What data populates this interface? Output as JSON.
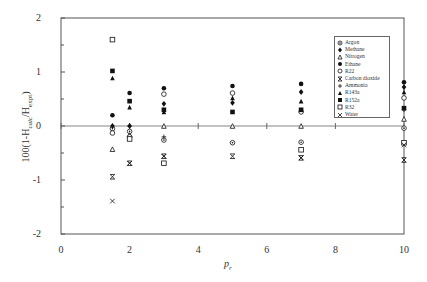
{
  "chart_data": {
    "type": "scatter",
    "title": "",
    "xlabel": "p r",
    "ylabel": "100(1-H calc/H expt)",
    "xlim": [
      0,
      10
    ],
    "ylim": [
      -2,
      2
    ],
    "xticks": [
      0,
      2,
      4,
      6,
      8,
      10
    ],
    "yticks": [
      -2,
      -1,
      0,
      1,
      2
    ],
    "grid": false,
    "legend_position": "upper right (inside)",
    "series": [
      {
        "name": "Argon",
        "marker": "circle-dot",
        "points": [
          [
            1.5,
            -0.05
          ],
          [
            2,
            -0.1
          ],
          [
            3,
            -0.26
          ],
          [
            5,
            -0.31
          ],
          [
            7,
            -0.3
          ],
          [
            10,
            -0.04
          ]
        ]
      },
      {
        "name": "Methane",
        "marker": "diamond-filled",
        "points": [
          [
            1.5,
            0.0
          ],
          [
            2,
            0.0
          ],
          [
            3,
            0.41
          ],
          [
            5,
            0.43
          ],
          [
            7,
            0.63
          ],
          [
            10,
            0.72
          ]
        ]
      },
      {
        "name": "Nitrogen",
        "marker": "triangle-open",
        "points": [
          [
            1.5,
            -0.43
          ],
          [
            2,
            -0.17
          ],
          [
            3,
            0.0
          ],
          [
            5,
            0.0
          ],
          [
            7,
            0.0
          ],
          [
            10,
            0.13
          ]
        ]
      },
      {
        "name": "Ethane",
        "marker": "circle-filled",
        "points": [
          [
            1.5,
            0.2
          ],
          [
            2,
            0.61
          ],
          [
            3,
            0.7
          ],
          [
            5,
            0.74
          ],
          [
            7,
            0.78
          ],
          [
            10,
            0.81
          ]
        ]
      },
      {
        "name": "R22",
        "marker": "circle-open",
        "points": [
          [
            1.5,
            -0.13
          ],
          [
            2,
            -0.2
          ],
          [
            3,
            0.59
          ],
          [
            5,
            0.61
          ],
          [
            7,
            0.26
          ],
          [
            10,
            0.52
          ]
        ]
      },
      {
        "name": "Carbon dioxide",
        "marker": "square-x",
        "points": [
          [
            1.5,
            -0.94
          ],
          [
            2,
            -0.69
          ],
          [
            3,
            -0.56
          ],
          [
            5,
            -0.56
          ],
          [
            7,
            -0.59
          ],
          [
            10,
            -0.63
          ]
        ]
      },
      {
        "name": "Ammonia",
        "marker": "plus",
        "points": [
          [
            2,
            0.0
          ],
          [
            3,
            -0.2
          ],
          [
            10,
            0.3
          ]
        ]
      },
      {
        "name": "R143a",
        "marker": "triangle-filled",
        "points": [
          [
            1.5,
            0.89
          ],
          [
            2,
            0.35
          ],
          [
            3,
            0.26
          ],
          [
            5,
            0.52
          ],
          [
            7,
            0.46
          ],
          [
            10,
            0.63
          ]
        ]
      },
      {
        "name": "R152a",
        "marker": "square-filled",
        "points": [
          [
            1.5,
            1.02
          ],
          [
            2,
            0.46
          ],
          [
            3,
            0.3
          ],
          [
            5,
            0.26
          ],
          [
            7,
            0.3
          ],
          [
            10,
            0.33
          ]
        ]
      },
      {
        "name": "R32",
        "marker": "square-open",
        "points": [
          [
            1.5,
            1.6
          ],
          [
            2,
            -0.24
          ],
          [
            3,
            -0.69
          ],
          [
            7,
            -0.44
          ],
          [
            10,
            -0.31
          ]
        ]
      },
      {
        "name": "Water",
        "marker": "x",
        "points": [
          [
            1.5,
            -1.39
          ],
          [
            2,
            -0.69
          ],
          [
            3,
            -0.56
          ],
          [
            7,
            -0.59
          ],
          [
            10,
            -0.35
          ]
        ]
      }
    ]
  },
  "axes": {
    "xlabel": "p",
    "xlabel_sub": "r",
    "ylabel": "100(1-H",
    "ylabel_sub1": "calc",
    "ylabel_mid": "/H",
    "ylabel_sub2": "expt",
    "ylabel_end": ")"
  },
  "legend": {
    "items": [
      "Argon",
      "Methane",
      "Nitrogen",
      "Ethane",
      "R22",
      "Carbon dioxide",
      "Ammonia",
      "R143a",
      "R152a",
      "R32",
      "Water"
    ]
  }
}
